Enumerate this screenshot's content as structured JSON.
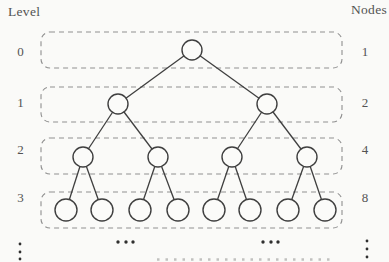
{
  "diagram": {
    "left_header": "Level",
    "right_header": "Nodes",
    "label_columns": {
      "left_x": 20.5,
      "right_x": 365
    },
    "levels": [
      {
        "level": "0",
        "node_count": "1",
        "label_baseline": 56,
        "box": {
          "x": 41,
          "y": 32,
          "w": 301,
          "h": 36,
          "r": 9
        },
        "node_y": 50,
        "node_r": 10,
        "node_xs": [
          192
        ]
      },
      {
        "level": "1",
        "node_count": "2",
        "label_baseline": 107,
        "box": {
          "x": 41,
          "y": 87,
          "w": 301,
          "h": 35,
          "r": 9
        },
        "node_y": 104,
        "node_r": 10,
        "node_xs": [
          118,
          267
        ]
      },
      {
        "level": "2",
        "node_count": "4",
        "label_baseline": 154,
        "box": {
          "x": 41,
          "y": 138,
          "w": 301,
          "h": 36,
          "r": 9
        },
        "node_y": 157,
        "node_r": 10,
        "node_xs": [
          83,
          158,
          232,
          307
        ]
      },
      {
        "level": "3",
        "node_count": "8",
        "label_baseline": 202,
        "box": {
          "x": 41,
          "y": 192,
          "w": 301,
          "h": 36,
          "r": 9
        },
        "node_y": 210,
        "node_r": 11,
        "node_xs": [
          66,
          102,
          140,
          178,
          214,
          250,
          288,
          325
        ]
      }
    ],
    "ellipses": {
      "vertical_left": {
        "x": 20,
        "dot_ys": [
          244,
          252,
          259
        ],
        "dot_r": 1.4
      },
      "vertical_right": {
        "x": 367,
        "dot_ys": [
          241,
          249,
          257
        ],
        "dot_r": 1.4
      },
      "horizontal_left": {
        "y": 242,
        "dot_xs": [
          118,
          126,
          133
        ],
        "dot_r": 1.7
      },
      "horizontal_right": {
        "y": 242,
        "dot_xs": [
          263,
          271,
          278
        ],
        "dot_r": 1.7
      }
    },
    "caption_fragment": {
      "x1": 157,
      "x2": 333,
      "y": 259.5,
      "opacity": 0.3
    },
    "colors": {
      "background": "#fafaf8",
      "line": "#3f3f3f",
      "box_dash": "#8f8f8f",
      "text": "#535353",
      "dot": "#2f2f2f",
      "node_fill": "#fbfbf9"
    }
  }
}
